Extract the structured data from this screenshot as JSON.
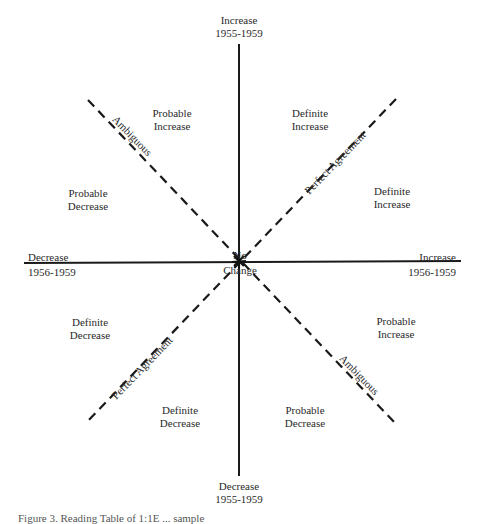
{
  "diagram": {
    "colors": {
      "line": "#1a1a1a",
      "text": "#2a2a2a",
      "background": "#ffffff"
    },
    "axes": {
      "vertical_top": {
        "line1": "Increase",
        "line2": "1955-1959"
      },
      "vertical_bottom": {
        "line1": "Decrease",
        "line2": "1955-1959"
      },
      "horizontal_left": {
        "line1": "Decrease",
        "line2": "1956-1959"
      },
      "horizontal_right": {
        "line1": "Increase",
        "line2": "1956-1959"
      },
      "center": {
        "line1": "No",
        "line2": "Change"
      }
    },
    "diagonals": {
      "perfect_agreement_upper": "Perfect Agreement",
      "perfect_agreement_lower": "Perfect Agreement",
      "ambiguous_upper": "Ambiguous",
      "ambiguous_lower": "Ambiguous"
    },
    "regions": [
      {
        "id": "nnw",
        "line1": "Probable",
        "line2": "Increase"
      },
      {
        "id": "nne",
        "line1": "Definite",
        "line2": "Increase"
      },
      {
        "id": "ene",
        "line1": "Definite",
        "line2": "Increase"
      },
      {
        "id": "wnw",
        "line1": "Probable",
        "line2": "Decrease"
      },
      {
        "id": "wsw",
        "line1": "Definite",
        "line2": "Decrease"
      },
      {
        "id": "ssw",
        "line1": "Definite",
        "line2": "Decrease"
      },
      {
        "id": "sse",
        "line1": "Probable",
        "line2": "Decrease"
      },
      {
        "id": "ese",
        "line1": "Probable",
        "line2": "Increase"
      }
    ],
    "caption": "Figure 3.  Reading Table of 1:1E ... sample"
  }
}
